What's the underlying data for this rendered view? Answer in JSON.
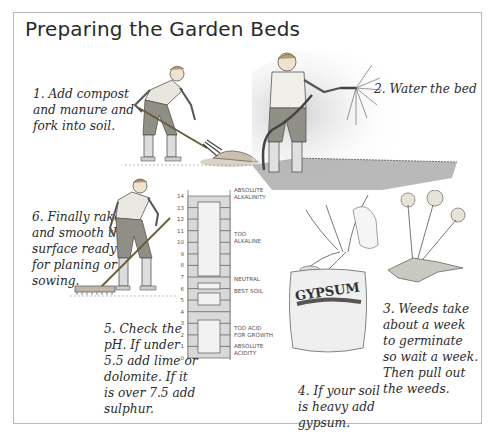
{
  "title": "Preparing the Garden Beds",
  "steps": [
    {
      "number": 1,
      "text": "1. Add compost\nand manure and\nfork into soil."
    },
    {
      "number": 2,
      "text": "2. Water the bed"
    },
    {
      "number": 3,
      "text": "3. Weeds take\nabout a week\nto germinate\nso wait a week.\nThen pull out\nthe weeds."
    },
    {
      "number": 4,
      "text": "4. If your soil\nis heavy add\ngypsum."
    },
    {
      "number": 5,
      "text": "5. Check the\npH. If under\n5.5 add lime or\ndolomite. If it\nis over 7.5 add\nsulphur."
    },
    {
      "number": 6,
      "text": "6. Finally rake\nand smooth the\nsurface ready\nfor planing or\nsowing."
    }
  ],
  "ph_scale": {
    "ticks": [
      "14",
      "13",
      "12",
      "11",
      "10",
      "9",
      "8",
      "7",
      "6",
      "5",
      "4",
      "3",
      "2",
      "1",
      "0"
    ],
    "labels": {
      "absolute_alkalinity": "Absolute\nAlkalinity",
      "too_alkaline": "Too\nAlkaline",
      "neutral": "Neutral",
      "best_soil": "Best Soil",
      "too_acid": "Too Acid\nfor Growth",
      "absolute_acidity": "Absolute\nAcidity"
    }
  },
  "gypsum_bag": {
    "label": "GYPSUM"
  },
  "icons": {
    "step1": "person-forking-compost-illustration",
    "step2": "person-watering-hose-illustration",
    "step3": "weeds-illustration",
    "step4": "gypsum-bag-illustration",
    "step5": "ph-scale-chart",
    "step6": "person-raking-illustration"
  }
}
